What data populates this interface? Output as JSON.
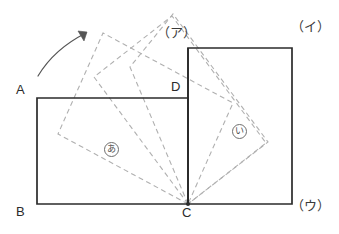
{
  "figure": {
    "canvas": {
      "width": 339,
      "height": 234
    },
    "colors": {
      "solid_stroke": "#2b2b2b",
      "dashed_stroke": "#b0b0b0",
      "arrow_stroke": "#555555",
      "background": "#ffffff",
      "label_text": "#2b2b2b"
    }
  },
  "vertex_labels": [
    {
      "name": "A",
      "text": "A",
      "x": 16,
      "y": 83
    },
    {
      "name": "B",
      "text": "B",
      "x": 16,
      "y": 205
    },
    {
      "name": "C",
      "text": "C",
      "x": 182,
      "y": 206
    },
    {
      "name": "D",
      "text": "D",
      "x": 171,
      "y": 80
    }
  ],
  "choice_labels": [
    {
      "name": "choice-a",
      "text": "（ア）",
      "x": 157,
      "y": 26
    },
    {
      "name": "choice-i",
      "text": "（イ）",
      "x": 291,
      "y": 20
    },
    {
      "name": "choice-u",
      "text": "（ウ）",
      "x": 291,
      "y": 199
    }
  ],
  "region_labels": [
    {
      "name": "region-a",
      "text": "あ",
      "x": 104,
      "y": 139
    },
    {
      "name": "region-i",
      "text": "い",
      "x": 232,
      "y": 121
    }
  ],
  "solid_shapes": {
    "rectangle_abcd": {
      "label": "ABCD",
      "points": "37,98 188,98 188,204 37,204"
    },
    "square_right": {
      "label": "C-right-square",
      "points": "188,48 292,48 292,204 188,204"
    },
    "vertical_edge_dc": {
      "label": "D-C edge",
      "x1": 188,
      "y1": 48,
      "x2": 188,
      "y2": 204
    }
  },
  "dashed_shapes": [
    {
      "name": "rotated-rect-stage-1",
      "points": "188,204 58,134 103,33 233,103"
    },
    {
      "name": "rotated-rect-stage-2",
      "points": "188,204 94,77 172,16 266,143"
    },
    {
      "name": "rotated-rect-stage-3",
      "points": "188,204 130,67 173,14 268,142"
    }
  ],
  "rotation_arrow": {
    "name": "rotation-direction-arrow",
    "path": "M 38,76 C 50,56 68,42 86,33",
    "arrowhead": "84,41 87,32 78,31"
  },
  "pivot_point": {
    "name": "pivot-C",
    "x": 188,
    "y": 204,
    "r": 2
  }
}
